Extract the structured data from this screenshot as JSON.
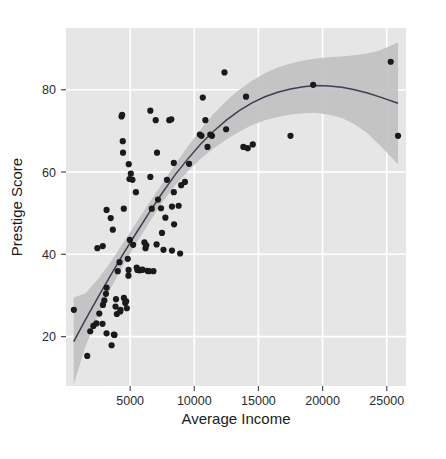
{
  "chart_data": {
    "type": "scatter",
    "title": "",
    "xlabel": "Average Income",
    "ylabel": "Prestige Score",
    "xlim": [
      0,
      26500
    ],
    "ylim": [
      8,
      95
    ],
    "xticks": [
      5000,
      10000,
      15000,
      20000,
      25000
    ],
    "xticklabels": [
      "5000",
      "10000",
      "15000",
      "20000",
      "25000"
    ],
    "yticks": [
      20,
      40,
      60,
      80
    ],
    "yticklabels": [
      "20",
      "40",
      "60",
      "80"
    ],
    "grid": true,
    "grid_color": "#ffffff",
    "panel_background": "#e6e6e6",
    "legend": "none",
    "point_color": "#1a1a1a",
    "point_size": 3.1,
    "line_color": "#3d3d55",
    "band_color": "#bdbdbd",
    "band_label": "95% confidence interval",
    "smoother_label": "LOESS fit",
    "points": [
      [
        611,
        26.5
      ],
      [
        1656,
        15.3
      ],
      [
        1890,
        21.3
      ],
      [
        2132,
        22.6
      ],
      [
        2370,
        23.2
      ],
      [
        2448,
        41.5
      ],
      [
        2594,
        25.6
      ],
      [
        2847,
        23.1
      ],
      [
        2865,
        42.0
      ],
      [
        2880,
        27.7
      ],
      [
        2989,
        28.8
      ],
      [
        3116,
        30.4
      ],
      [
        3161,
        20.8
      ],
      [
        3162,
        31.9
      ],
      [
        3163,
        50.8
      ],
      [
        3485,
        48.8
      ],
      [
        3554,
        17.9
      ],
      [
        3649,
        46.0
      ],
      [
        3731,
        20.5
      ],
      [
        3781,
        20.4
      ],
      [
        3859,
        27.3
      ],
      [
        3897,
        29.1
      ],
      [
        3962,
        25.5
      ],
      [
        4036,
        35.9
      ],
      [
        4172,
        38.1
      ],
      [
        4229,
        26.1
      ],
      [
        4241,
        26.5
      ],
      [
        4330,
        73.5
      ],
      [
        4376,
        73.9
      ],
      [
        4424,
        67.5
      ],
      [
        4443,
        64.7
      ],
      [
        4504,
        51.1
      ],
      [
        4512,
        29.4
      ],
      [
        4614,
        28.2
      ],
      [
        4696,
        28.6
      ],
      [
        4741,
        26.9
      ],
      [
        4816,
        38.9
      ],
      [
        4866,
        34.8
      ],
      [
        4877,
        36.2
      ],
      [
        4891,
        61.9
      ],
      [
        4946,
        58.3
      ],
      [
        4975,
        43.5
      ],
      [
        5052,
        59.6
      ],
      [
        5180,
        58.1
      ],
      [
        5234,
        42.3
      ],
      [
        5449,
        55.1
      ],
      [
        5511,
        36.8
      ],
      [
        5562,
        36.2
      ],
      [
        5653,
        36.2
      ],
      [
        5716,
        36.1
      ],
      [
        5902,
        36.2
      ],
      [
        5959,
        36.3
      ],
      [
        6112,
        42.9
      ],
      [
        6197,
        41.5
      ],
      [
        6259,
        42.2
      ],
      [
        6336,
        36.0
      ],
      [
        6462,
        35.9
      ],
      [
        6573,
        58.8
      ],
      [
        6573,
        74.9
      ],
      [
        6686,
        51.1
      ],
      [
        6813,
        35.9
      ],
      [
        6992,
        72.6
      ],
      [
        7059,
        42.4
      ],
      [
        7094,
        64.7
      ],
      [
        7170,
        53.3
      ],
      [
        7405,
        51.2
      ],
      [
        7482,
        45.2
      ],
      [
        7597,
        41.1
      ],
      [
        7746,
        48.9
      ],
      [
        7869,
        58.1
      ],
      [
        8049,
        72.6
      ],
      [
        8206,
        72.8
      ],
      [
        8258,
        40.9
      ],
      [
        8258,
        51.6
      ],
      [
        8403,
        55.1
      ],
      [
        8403,
        62.2
      ],
      [
        8425,
        47.3
      ],
      [
        8780,
        51.8
      ],
      [
        8895,
        40.2
      ],
      [
        8978,
        56.8
      ],
      [
        9271,
        57.6
      ],
      [
        9593,
        62.0
      ],
      [
        10432,
        69.1
      ],
      [
        10559,
        68.8
      ],
      [
        10660,
        78.1
      ],
      [
        10865,
        72.6
      ],
      [
        11030,
        66.1
      ],
      [
        11247,
        69.1
      ],
      [
        11377,
        68.8
      ],
      [
        12351,
        84.2
      ],
      [
        12480,
        70.4
      ],
      [
        13823,
        66.1
      ],
      [
        14032,
        78.3
      ],
      [
        14163,
        65.8
      ],
      [
        14558,
        66.7
      ],
      [
        17498,
        68.8
      ],
      [
        19263,
        81.2
      ],
      [
        25308,
        86.8
      ],
      [
        25879,
        68.8
      ]
    ],
    "smooth_line": [
      [
        600,
        18.8
      ],
      [
        1500,
        24.0
      ],
      [
        2500,
        29.6
      ],
      [
        3500,
        35.0
      ],
      [
        4500,
        40.3
      ],
      [
        5500,
        45.3
      ],
      [
        6500,
        50.2
      ],
      [
        7500,
        54.9
      ],
      [
        8500,
        59.3
      ],
      [
        9500,
        63.2
      ],
      [
        10500,
        66.8
      ],
      [
        11500,
        69.9
      ],
      [
        12500,
        72.6
      ],
      [
        13500,
        74.9
      ],
      [
        14500,
        76.8
      ],
      [
        15500,
        78.3
      ],
      [
        16500,
        79.4
      ],
      [
        17500,
        80.2
      ],
      [
        18500,
        80.7
      ],
      [
        19500,
        81.0
      ],
      [
        20500,
        80.9
      ],
      [
        21500,
        80.6
      ],
      [
        22500,
        80.0
      ],
      [
        23500,
        79.2
      ],
      [
        24500,
        78.2
      ],
      [
        25879,
        76.7
      ]
    ],
    "band_upper": [
      [
        600,
        29.5
      ],
      [
        1500,
        30.5
      ],
      [
        2500,
        34.0
      ],
      [
        3500,
        38.2
      ],
      [
        4500,
        43.0
      ],
      [
        5500,
        47.8
      ],
      [
        6500,
        52.6
      ],
      [
        7500,
        57.2
      ],
      [
        8500,
        61.8
      ],
      [
        9500,
        66.2
      ],
      [
        10500,
        70.4
      ],
      [
        11500,
        74.1
      ],
      [
        12500,
        77.3
      ],
      [
        13500,
        80.0
      ],
      [
        14500,
        82.2
      ],
      [
        15500,
        84.0
      ],
      [
        16500,
        85.4
      ],
      [
        17500,
        86.4
      ],
      [
        18500,
        87.1
      ],
      [
        19500,
        87.6
      ],
      [
        20500,
        87.9
      ],
      [
        21500,
        88.1
      ],
      [
        22500,
        88.4
      ],
      [
        23500,
        88.8
      ],
      [
        24500,
        89.6
      ],
      [
        25879,
        91.5
      ]
    ],
    "band_lower": [
      [
        600,
        8.3
      ],
      [
        1500,
        17.5
      ],
      [
        2500,
        25.2
      ],
      [
        3500,
        31.8
      ],
      [
        4500,
        37.6
      ],
      [
        5500,
        42.8
      ],
      [
        6500,
        47.8
      ],
      [
        7500,
        52.6
      ],
      [
        8500,
        56.8
      ],
      [
        9500,
        60.2
      ],
      [
        10500,
        63.2
      ],
      [
        11500,
        65.7
      ],
      [
        12500,
        67.9
      ],
      [
        13500,
        69.8
      ],
      [
        14500,
        71.4
      ],
      [
        15500,
        72.6
      ],
      [
        16500,
        73.4
      ],
      [
        17500,
        74.0
      ],
      [
        18500,
        74.3
      ],
      [
        19500,
        74.4
      ],
      [
        20500,
        73.9
      ],
      [
        21500,
        73.1
      ],
      [
        22500,
        71.6
      ],
      [
        23500,
        69.4
      ],
      [
        24500,
        66.4
      ],
      [
        25879,
        61.9
      ]
    ]
  }
}
